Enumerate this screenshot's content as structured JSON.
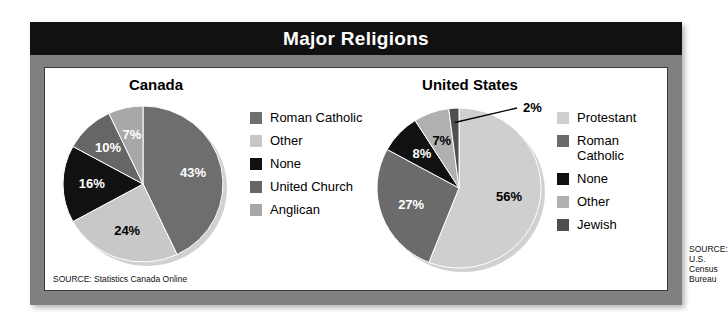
{
  "figure": {
    "title": "Major Religions",
    "accent_dark": "#111111",
    "frame_color": "#808080",
    "panel_bg": "#ffffff"
  },
  "charts": [
    {
      "key": "canada",
      "title": "Canada",
      "source": "SOURCE: Statistics Canada Online",
      "legend": [
        {
          "label": "Roman Catholic",
          "color": "#6e6e6e"
        },
        {
          "label": "Other",
          "color": "#c8c8c8"
        },
        {
          "label": "None",
          "color": "#111111"
        },
        {
          "label": "United Church",
          "color": "#666666"
        },
        {
          "label": "Anglican",
          "color": "#a8a8a8"
        }
      ]
    },
    {
      "key": "us",
      "title": "United States",
      "source": "SOURCE: U.S. Census Bureau",
      "legend": [
        {
          "label": "Protestant",
          "color": "#cfcfcf"
        },
        {
          "label": "Roman\nCatholic",
          "color": "#6b6b6b"
        },
        {
          "label": "None",
          "color": "#111111"
        },
        {
          "label": "Other",
          "color": "#b0b0b0"
        },
        {
          "label": "Jewish",
          "color": "#4f4f4f"
        }
      ]
    }
  ],
  "chart_data": [
    {
      "type": "pie",
      "title": "Canada",
      "source": "SOURCE: Statistics Canada Online",
      "categories": [
        "Roman Catholic",
        "Other",
        "None",
        "United Church",
        "Anglican"
      ],
      "values": [
        43,
        24,
        16,
        10,
        7
      ],
      "value_labels": [
        "43%",
        "24%",
        "16%",
        "10%",
        "7%"
      ],
      "colors": [
        "#6e6e6e",
        "#c8c8c8",
        "#111111",
        "#666666",
        "#a8a8a8"
      ],
      "label_colors": [
        "#ffffff",
        "#000000",
        "#ffffff",
        "#ffffff",
        "#ffffff"
      ],
      "unit": "percent",
      "start_angle": 0,
      "direction": "clockwise",
      "legend_position": "right",
      "grid": false
    },
    {
      "type": "pie",
      "title": "United States",
      "source": "SOURCE: U.S. Census Bureau",
      "categories": [
        "Protestant",
        "Roman Catholic",
        "None",
        "Other",
        "Jewish"
      ],
      "values": [
        56,
        27,
        8,
        7,
        2
      ],
      "value_labels": [
        "56%",
        "27%",
        "8%",
        "7%",
        "2%"
      ],
      "colors": [
        "#cfcfcf",
        "#6b6b6b",
        "#111111",
        "#b0b0b0",
        "#4f4f4f"
      ],
      "label_colors": [
        "#000000",
        "#ffffff",
        "#ffffff",
        "#000000",
        "#000000"
      ],
      "unit": "percent",
      "start_angle": 0,
      "direction": "clockwise",
      "legend_position": "right",
      "grid": false,
      "callout_labels": [
        {
          "category": "Jewish",
          "text": "2%",
          "leader": true
        }
      ]
    }
  ]
}
